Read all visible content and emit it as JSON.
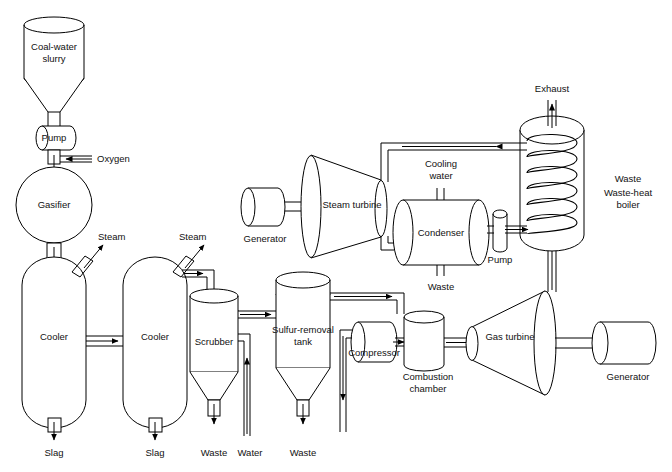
{
  "diagram": {
    "type": "process-flow-diagram",
    "background_color": "#ffffff",
    "line_color": "#000000",
    "text_color": "#111111"
  },
  "labels": {
    "coal_water_slurry": "Coal-water\nslurry",
    "coal_water_slurry_line1": "Coal-water",
    "coal_water_slurry_line2": "slurry",
    "pump_top": "Pump",
    "oxygen": "Oxygen",
    "gasifier": "Gasifier",
    "steam_left": "Steam",
    "steam_right": "Steam",
    "cooler_left": "Cooler",
    "cooler_right": "Cooler",
    "slag_left": "Slag",
    "slag_right": "Slag",
    "scrubber": "Scrubber",
    "waste_scrubber": "Waste",
    "water": "Water",
    "sulfur_removal_line1": "Sulfur-removal",
    "sulfur_removal_line2": "tank",
    "waste_sulfur": "Waste",
    "compressor": "Compressor",
    "combustion_line1": "Combustion",
    "combustion_line2": "chamber",
    "gas_turbine": "Gas turbine",
    "generator_right": "Generator",
    "generator_left": "Generator",
    "steam_turbine": "Steam turbine",
    "cooling_water_line1": "Cooling",
    "cooling_water_line2": "water",
    "condenser": "Condenser",
    "waste_condenser": "Waste",
    "pump_condenser": "Pump",
    "exhaust": "Exhaust",
    "waste_boiler": "Waste",
    "waste_heat_boiler_line1": "Waste-heat",
    "waste_heat_boiler_line2": "boiler"
  },
  "equipment": [
    {
      "id": "coal-water-slurry-hopper",
      "label": "Coal-water slurry",
      "shape": "cylinder-with-cone-bottom"
    },
    {
      "id": "slurry-pump",
      "label": "Pump",
      "shape": "horizontal-cylinder"
    },
    {
      "id": "gasifier",
      "label": "Gasifier",
      "shape": "circle"
    },
    {
      "id": "cooler-1",
      "label": "Cooler",
      "shape": "vertical-capsule"
    },
    {
      "id": "cooler-2",
      "label": "Cooler",
      "shape": "vertical-capsule"
    },
    {
      "id": "scrubber",
      "label": "Scrubber",
      "shape": "vertical-vessel-cone-bottom"
    },
    {
      "id": "sulfur-removal-tank",
      "label": "Sulfur-removal tank",
      "shape": "vertical-vessel-cone-bottom"
    },
    {
      "id": "compressor",
      "label": "Compressor",
      "shape": "horizontal-cylinder"
    },
    {
      "id": "combustion-chamber",
      "label": "Combustion chamber",
      "shape": "vertical-cylinder"
    },
    {
      "id": "gas-turbine",
      "label": "Gas turbine",
      "shape": "cone"
    },
    {
      "id": "generator-gas",
      "label": "Generator",
      "shape": "horizontal-cylinder"
    },
    {
      "id": "waste-heat-boiler",
      "label": "Waste-heat boiler",
      "shape": "vertical-vessel-with-coil"
    },
    {
      "id": "steam-turbine",
      "label": "Steam turbine",
      "shape": "cone"
    },
    {
      "id": "generator-steam",
      "label": "Generator",
      "shape": "horizontal-cylinder"
    },
    {
      "id": "condenser",
      "label": "Condenser",
      "shape": "horizontal-cylinder"
    },
    {
      "id": "condensate-pump",
      "label": "Pump",
      "shape": "small-vertical-cylinder"
    }
  ],
  "streams": [
    {
      "id": "oxygen-feed",
      "label": "Oxygen",
      "direction": "left"
    },
    {
      "id": "steam-vent-1",
      "label": "Steam",
      "direction": "up-right"
    },
    {
      "id": "steam-vent-2",
      "label": "Steam",
      "direction": "up-right"
    },
    {
      "id": "slag-out-1",
      "label": "Slag",
      "direction": "down"
    },
    {
      "id": "slag-out-2",
      "label": "Slag",
      "direction": "down"
    },
    {
      "id": "waste-out-scrubber",
      "label": "Waste",
      "direction": "down"
    },
    {
      "id": "water-in-scrubber",
      "label": "Water",
      "direction": "up"
    },
    {
      "id": "waste-out-sulfur",
      "label": "Waste",
      "direction": "down"
    },
    {
      "id": "cooling-water-in",
      "label": "Cooling water",
      "direction": "down"
    },
    {
      "id": "waste-out-condenser",
      "label": "Waste",
      "direction": "down"
    },
    {
      "id": "exhaust-out",
      "label": "Exhaust",
      "direction": "up"
    },
    {
      "id": "waste-boiler",
      "label": "Waste",
      "direction": "none"
    }
  ]
}
